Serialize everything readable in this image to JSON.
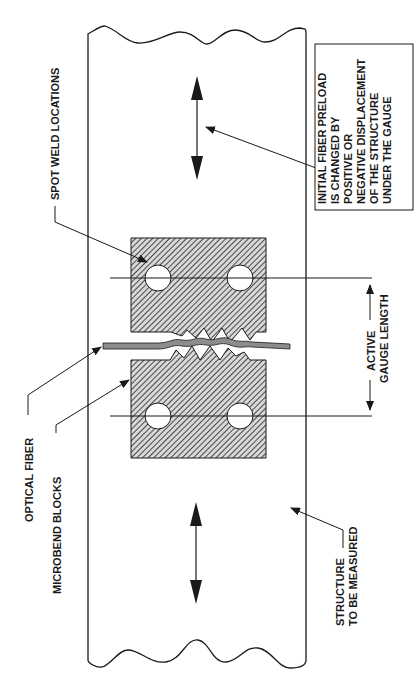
{
  "labels": {
    "spot_weld_locations": "SPOT WELD LOCATIONS",
    "optical_fiber": "OPTICAL FIBER",
    "microbend_blocks": "MICROBEND BLOCKS",
    "structure_line1": "STRUCTURE",
    "structure_line2": "TO BE MEASURED",
    "active_line1": "ACTIVE",
    "active_line2": "GAUGE LENGTH",
    "preload_box": [
      "INITIAL FIBER PRELOAD",
      "IS CHANGED BY",
      "POSITIVE OR",
      "NEGATIVE DISPLACEMENT",
      "OF THE STRUCTURE",
      "UNDER THE GAUGE"
    ]
  },
  "colors": {
    "ink": "#1a1a1a",
    "hatch_fill": "#9a9a9a",
    "fiber_fill": "#8c8c8c",
    "background": "#ffffff"
  }
}
